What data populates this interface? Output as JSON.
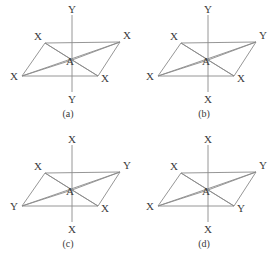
{
  "figure": {
    "type": "octahedral-isomer-diagram",
    "background_color": "#ffffff",
    "line_color": "#8a8a8a",
    "text_color": "#3a3a3a",
    "panel_count": 4,
    "center_atom": "A",
    "ligand_types": [
      "X",
      "Y"
    ],
    "geometry": {
      "note": "Each panel shows an octahedron drawn as a parallelogram of four equatorial ligands plus two axial ligands on a vertical line through the center atom A.",
      "equatorial_vertices": {
        "top_left": [
          45,
          43
        ],
        "top_right": [
          120,
          42
        ],
        "bottom_right": [
          98,
          76
        ],
        "bottom_left": [
          22,
          76
        ]
      },
      "center": [
        72,
        60
      ],
      "axis_top": [
        72,
        15
      ],
      "axis_bottom": [
        72,
        92
      ]
    }
  },
  "panels": [
    {
      "id": "panel-a",
      "caption": "(a)",
      "center": "A",
      "ligands": {
        "axial_top": "Y",
        "top_left": "X",
        "top_right": "X",
        "bottom_left": "X",
        "bottom_right": "X",
        "axial_bottom": "Y"
      }
    },
    {
      "id": "panel-b",
      "caption": "(b)",
      "center": "A",
      "ligands": {
        "axial_top": "Y",
        "top_left": "X",
        "top_right": "Y",
        "bottom_left": "X",
        "bottom_right": "X",
        "axial_bottom": "X"
      }
    },
    {
      "id": "panel-c",
      "caption": "(c)",
      "center": "A",
      "ligands": {
        "axial_top": "X",
        "top_left": "X",
        "top_right": "Y",
        "bottom_left": "Y",
        "bottom_right": "X",
        "axial_bottom": "X"
      }
    },
    {
      "id": "panel-d",
      "caption": "(d)",
      "center": "A",
      "ligands": {
        "axial_top": "X",
        "top_left": "X",
        "top_right": "Y",
        "bottom_left": "X",
        "bottom_right": "Y",
        "axial_bottom": "X"
      }
    }
  ]
}
